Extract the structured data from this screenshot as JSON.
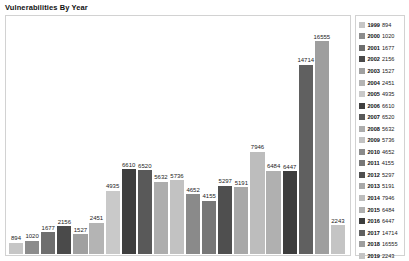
{
  "chart": {
    "title": "Vulnerabilities By Year"
  },
  "chart_data": {
    "type": "bar",
    "title": "Vulnerabilities By Year",
    "xlabel": "",
    "ylabel": "",
    "grid": false,
    "legend_position": "right",
    "ylim": [
      0,
      17500
    ],
    "categories": [
      "1999",
      "2000",
      "2001",
      "2002",
      "2003",
      "2004",
      "2005",
      "2006",
      "2007",
      "2008",
      "2009",
      "2010",
      "2011",
      "2012",
      "2013",
      "2014",
      "2015",
      "2016",
      "2017",
      "2018",
      "2019"
    ],
    "values": [
      894,
      1020,
      1677,
      2156,
      1527,
      2451,
      4935,
      6610,
      6520,
      5632,
      5736,
      4652,
      4155,
      5297,
      5191,
      7946,
      6484,
      6447,
      14714,
      16555,
      2243
    ],
    "colors": [
      "#c6c6c6",
      "#8c8c8c",
      "#6e6e6e",
      "#4a4a4a",
      "#a0a0a0",
      "#b4b4b4",
      "#c9c9c9",
      "#3f3f3f",
      "#595959",
      "#adadad",
      "#c2c2c2",
      "#8a8a8a",
      "#777777",
      "#4f4f4f",
      "#a8a8a8",
      "#bdbdbd",
      "#b0b0b0",
      "#3d3d3d",
      "#606060",
      "#9e9e9e",
      "#c4c4c4"
    ],
    "bar_labels": [
      "894",
      "1020",
      "1677",
      "2156",
      "1527",
      "2451",
      "4935",
      "6610",
      "6520",
      "5632",
      "5736",
      "4652",
      "4155",
      "5297",
      "5191",
      "7946",
      "6484",
      "6447",
      "14714",
      "16555",
      "2243"
    ]
  },
  "legend": {
    "items": [
      {
        "year": "1999",
        "value": "894",
        "color": "#c6c6c6"
      },
      {
        "year": "2000",
        "value": "1020",
        "color": "#8c8c8c"
      },
      {
        "year": "2001",
        "value": "1677",
        "color": "#6e6e6e"
      },
      {
        "year": "2002",
        "value": "2156",
        "color": "#4a4a4a"
      },
      {
        "year": "2003",
        "value": "1527",
        "color": "#a0a0a0"
      },
      {
        "year": "2004",
        "value": "2451",
        "color": "#b4b4b4"
      },
      {
        "year": "2005",
        "value": "4935",
        "color": "#c9c9c9"
      },
      {
        "year": "2006",
        "value": "6610",
        "color": "#3f3f3f"
      },
      {
        "year": "2007",
        "value": "6520",
        "color": "#595959"
      },
      {
        "year": "2008",
        "value": "5632",
        "color": "#adadad"
      },
      {
        "year": "2009",
        "value": "5736",
        "color": "#c2c2c2"
      },
      {
        "year": "2010",
        "value": "4652",
        "color": "#8a8a8a"
      },
      {
        "year": "2011",
        "value": "4155",
        "color": "#777777"
      },
      {
        "year": "2012",
        "value": "5297",
        "color": "#4f4f4f"
      },
      {
        "year": "2013",
        "value": "5191",
        "color": "#a8a8a8"
      },
      {
        "year": "2014",
        "value": "7946",
        "color": "#bdbdbd"
      },
      {
        "year": "2015",
        "value": "6484",
        "color": "#b0b0b0"
      },
      {
        "year": "2016",
        "value": "6447",
        "color": "#3d3d3d"
      },
      {
        "year": "2017",
        "value": "14714",
        "color": "#606060"
      },
      {
        "year": "2018",
        "value": "16555",
        "color": "#9e9e9e"
      },
      {
        "year": "2019",
        "value": "2243",
        "color": "#c4c4c4"
      }
    ]
  }
}
